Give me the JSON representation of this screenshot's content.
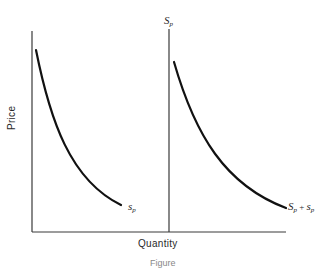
{
  "diagram": {
    "axes": {
      "y_label": "Price",
      "x_label": "Quantity"
    },
    "middle_line_label": {
      "main": "S",
      "sub": "p"
    },
    "curves": [
      {
        "name": "individual supply",
        "label_main": "s",
        "label_sub": "p",
        "shape": "downward-sloping convex"
      },
      {
        "name": "combined supply",
        "label_main": "S",
        "label_sub": "p",
        "label_plus": " + ",
        "label_main2": "s",
        "label_sub2": "p",
        "shape": "downward-sloping convex, shifted right of the Sp line"
      }
    ],
    "caption": "Figure"
  }
}
